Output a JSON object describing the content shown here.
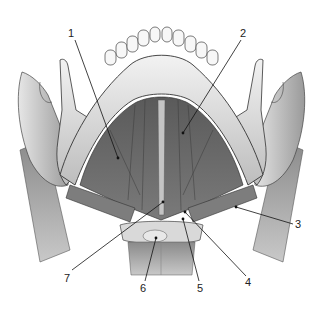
{
  "figure": {
    "labels": [
      {
        "id": "1",
        "text": "1",
        "x": 72,
        "y": 37,
        "tx": 118,
        "ty": 158
      },
      {
        "id": "2",
        "text": "2",
        "x": 244,
        "y": 37,
        "tx": 183,
        "ty": 133
      },
      {
        "id": "3",
        "text": "3",
        "x": 298,
        "y": 228,
        "tx": 236,
        "ty": 207
      },
      {
        "id": "4",
        "text": "4",
        "x": 249,
        "y": 284,
        "tx": 185,
        "ty": 212
      },
      {
        "id": "5",
        "text": "5",
        "x": 201,
        "y": 290,
        "tx": 183,
        "ty": 219
      },
      {
        "id": "6",
        "text": "6",
        "x": 143,
        "y": 290,
        "tx": 156,
        "ty": 238
      },
      {
        "id": "7",
        "text": "7",
        "x": 67,
        "y": 280,
        "tx": 163,
        "ty": 202
      }
    ]
  }
}
